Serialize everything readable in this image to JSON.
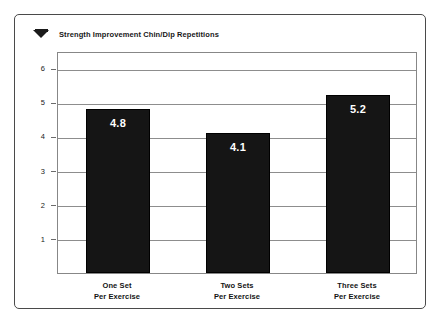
{
  "legend": {
    "marker_icon": "triangle-marker-icon",
    "label": "Strength Improvement Chin/Dip Repetitions"
  },
  "chart_data": {
    "type": "bar",
    "title": "Strength Improvement Chin/Dip Repetitions",
    "xlabel": "",
    "ylabel": "",
    "categories": [
      "One Set Per Exercise",
      "Two Sets Per Exercise",
      "Three Sets Per Exercise"
    ],
    "category_lines": [
      [
        "One Set",
        "Per Exercise"
      ],
      [
        "Two Sets",
        "Per Exercise"
      ],
      [
        "Three Sets",
        "Per Exercise"
      ]
    ],
    "values": [
      4.8,
      4.1,
      5.2
    ],
    "value_labels": [
      "4.8",
      "4.1",
      "5.2"
    ],
    "yticks": [
      1,
      2,
      3,
      4,
      5,
      6
    ],
    "ytick_labels": [
      "1",
      "2",
      "3",
      "4",
      "5",
      "6"
    ],
    "ylim": [
      0,
      6.5
    ],
    "grid": true,
    "grid_axis": "y",
    "legend_position": "top-left",
    "bar_color": "#151515",
    "value_label_color": "#ffffff",
    "grid_color": "#8d8d8d",
    "frame_color": "#878787",
    "outer_frame_color": "#4a4a4a"
  }
}
